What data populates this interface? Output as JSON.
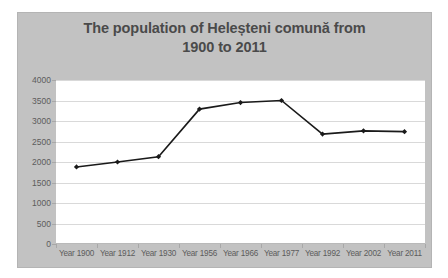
{
  "chart_data": {
    "type": "line",
    "title": "The population of Heleșteni comună from 1900 to 2011",
    "title_lines": [
      "The population of Heleșteni comună from",
      "1900 to 2011"
    ],
    "xlabel": "",
    "ylabel": "",
    "categories": [
      "Year 1900",
      "Year 1912",
      "Year 1930",
      "Year 1956",
      "Year 1966",
      "Year 1977",
      "Year 1992",
      "Year 2002",
      "Year 2011"
    ],
    "values": [
      1880,
      2000,
      2130,
      3290,
      3450,
      3500,
      2680,
      2760,
      2740
    ],
    "series": [
      {
        "name": "Population",
        "values": [
          1880,
          2000,
          2130,
          3290,
          3450,
          3500,
          2680,
          2760,
          2740
        ]
      }
    ],
    "ylim": [
      0,
      4000
    ],
    "ytick_labels": [
      "4000",
      "3500",
      "3000",
      "2500",
      "2000",
      "1500",
      "1000",
      "500",
      "0"
    ],
    "ytick_values": [
      4000,
      3500,
      3000,
      2500,
      2000,
      1500,
      1000,
      500,
      0
    ],
    "ytick_step": 500,
    "grid": true,
    "grid_axis": "y",
    "legend": false,
    "legend_position": "none",
    "marker": "diamond",
    "line_color": "#1a1a1a",
    "marker_color": "#1a1a1a",
    "plot_background": "#ffffff",
    "chart_background": "#c2c2c2",
    "gridline_color": "#d9d9d9",
    "title_color": "#4a4a4a",
    "tick_label_color": "#5c5c5c"
  }
}
